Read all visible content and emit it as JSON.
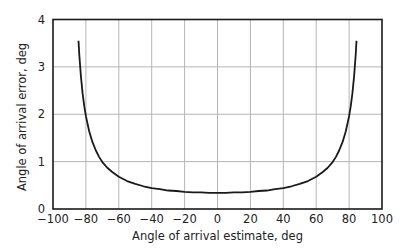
{
  "chart_data": {
    "type": "line",
    "title": "",
    "xlabel": "Angle of arrival estimate, deg",
    "ylabel": "Angle of arrival error, deg",
    "xlim": [
      -100,
      100
    ],
    "ylim": [
      0,
      4
    ],
    "xticks": [
      -100,
      -80,
      -60,
      -40,
      -20,
      0,
      20,
      40,
      60,
      80,
      100
    ],
    "yticks": [
      0,
      1,
      2,
      3,
      4
    ],
    "grid": true,
    "legend": null,
    "series": [
      {
        "name": "AOA error",
        "color": "#1a1a1a",
        "x": [
          -84.5,
          -84,
          -83,
          -82,
          -81,
          -80,
          -78,
          -76,
          -74,
          -72,
          -70,
          -67,
          -64,
          -60,
          -55,
          -50,
          -45,
          -40,
          -35,
          -30,
          -25,
          -20,
          -15,
          -10,
          -5,
          0,
          5,
          10,
          15,
          20,
          25,
          30,
          35,
          40,
          45,
          50,
          55,
          60,
          64,
          67,
          70,
          72,
          74,
          76,
          78,
          80,
          81,
          82,
          83,
          84,
          84.5
        ],
        "y": [
          3.55,
          3.25,
          2.79,
          2.44,
          2.17,
          1.96,
          1.64,
          1.41,
          1.24,
          1.1,
          0.99,
          0.87,
          0.78,
          0.68,
          0.59,
          0.53,
          0.48,
          0.44,
          0.42,
          0.39,
          0.38,
          0.36,
          0.35,
          0.35,
          0.34,
          0.34,
          0.34,
          0.35,
          0.35,
          0.36,
          0.38,
          0.39,
          0.42,
          0.44,
          0.48,
          0.53,
          0.59,
          0.68,
          0.78,
          0.87,
          0.99,
          1.1,
          1.24,
          1.41,
          1.64,
          1.96,
          2.17,
          2.44,
          2.79,
          3.25,
          3.55
        ]
      }
    ]
  },
  "axes": {
    "x_title": "Angle of arrival estimate, deg",
    "y_title": "Angle of arrival error, deg",
    "x_tick_labels": [
      "−100",
      "−80",
      "−60",
      "−40",
      "−20",
      "0",
      "20",
      "40",
      "60",
      "80",
      "100"
    ],
    "y_tick_labels": [
      "0",
      "1",
      "2",
      "3",
      "4"
    ]
  },
  "colors": {
    "line": "#1a1a1a",
    "grid": "#b5b5b5",
    "frame": "#1a1a1a"
  }
}
